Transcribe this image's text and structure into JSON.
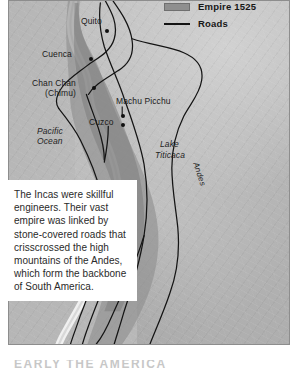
{
  "figure": {
    "name": "inca-empire-map",
    "legend": {
      "items": [
        {
          "label": "Empire 1525",
          "symbol": "area-swatch",
          "color": "#8f8f8f"
        },
        {
          "label": "Roads",
          "symbol": "line",
          "color": "#141414"
        }
      ]
    },
    "places": [
      {
        "name": "Quito",
        "label": "Quito"
      },
      {
        "name": "Cuenca",
        "label": "Cuenca"
      },
      {
        "name": "Chan Chan",
        "label": "Chan Chan",
        "label2": "(Chimu)"
      },
      {
        "name": "Machu Picchu",
        "label": "Machu Picchu"
      },
      {
        "name": "Cuzco",
        "label": "Cuzco"
      }
    ],
    "features": [
      {
        "name": "pacific-ocean",
        "line1": "Pacific",
        "line2": "Ocean"
      },
      {
        "name": "lake-titicaca",
        "line1": "Lake",
        "line2": "Titicaca"
      },
      {
        "name": "andes",
        "line1": "Andes"
      }
    ]
  },
  "caption": {
    "text": "The Incas were skillful engineers. Their vast empire was linked by stone-covered roads that crisscrossed the high mountains of the Andes, which form the backbone of South America."
  },
  "running_head": {
    "text": "EARLY THE AMERICA"
  },
  "colors": {
    "land": "#bcbcbc",
    "ocean": "#b7b7b7",
    "empire": "#8f8f8f",
    "road": "#141414",
    "text": "#1b1b1b",
    "caption_bg": "#ffffff"
  }
}
